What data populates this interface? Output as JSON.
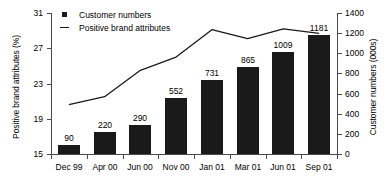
{
  "chart_data": {
    "type": "bar",
    "title": "",
    "subtitle": "",
    "xlabel": "",
    "categories": [
      "Dec 99",
      "Apr 00",
      "Jun 00",
      "Nov 00",
      "Jan 01",
      "Mar 01",
      "Jun 01",
      "Sep 01"
    ],
    "grid": false,
    "legend_position": "top-left",
    "legend": [
      "Customer numbers",
      "Positive brand attributes"
    ],
    "series": [
      {
        "name": "Customer numbers",
        "type": "bar",
        "axis": "right",
        "ylabel": "Customer numbers (000s)",
        "ylim": [
          0,
          1400
        ],
        "yticks": [
          0,
          200,
          400,
          600,
          800,
          1000,
          1200,
          1400
        ],
        "values": [
          90,
          220,
          290,
          552,
          731,
          865,
          1009,
          1181
        ],
        "data_labels": [
          "90",
          "220",
          "290",
          "552",
          "731",
          "865",
          "1009",
          "1181"
        ],
        "color": "#1a1a1a"
      },
      {
        "name": "Positive brand attributes",
        "type": "line",
        "axis": "left",
        "ylabel": "Positive brand attributes (%)",
        "ylim": [
          15,
          31
        ],
        "yticks": [
          15,
          19,
          23,
          27,
          31
        ],
        "values": [
          20.6,
          21.5,
          24.5,
          26.0,
          29.1,
          28.1,
          29.2,
          28.7
        ],
        "color": "#1a1a1a"
      }
    ]
  }
}
